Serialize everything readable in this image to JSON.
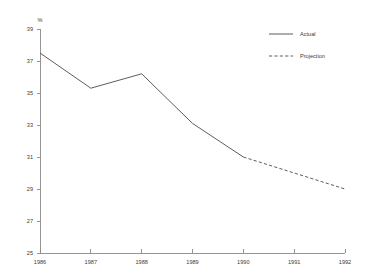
{
  "chart_data": {
    "type": "line",
    "title": "",
    "subtitle": "",
    "xlabel": "",
    "ylabel": "%",
    "y_unit_label": "%",
    "x": [
      1986,
      1987,
      1988,
      1989,
      1990,
      1991,
      1992
    ],
    "xtick_labels": [
      "1986",
      "1987",
      "1988",
      "1989",
      "1990",
      "1991",
      "1992"
    ],
    "ytick_labels": [
      "25",
      "27",
      "29",
      "31",
      "33",
      "35",
      "37",
      "39"
    ],
    "ytick_values": [
      25,
      27,
      29,
      31,
      33,
      35,
      37,
      39
    ],
    "ylim": [
      25,
      39
    ],
    "xlim": [
      1986,
      1992
    ],
    "grid": false,
    "legend_position": "top-right",
    "series": [
      {
        "name": "Actual",
        "style": "solid",
        "color": "#4a4a4a",
        "x": [
          1986,
          1987,
          1988,
          1989,
          1990
        ],
        "values": [
          37.5,
          35.3,
          36.2,
          33.1,
          31.0
        ]
      },
      {
        "name": "Projection",
        "style": "dashed",
        "color": "#4a4a4a",
        "x": [
          1990,
          1991,
          1992
        ],
        "values": [
          31.0,
          30.0,
          29.0
        ]
      }
    ],
    "annotations": []
  },
  "legend": {
    "entries": [
      {
        "label": "Actual",
        "style": "solid"
      },
      {
        "label": "Projection",
        "style": "dashed"
      }
    ]
  },
  "colors": {
    "background": "#ffffff",
    "axis": "#8a8a8a",
    "line": "#4a4a4a",
    "text": "#3a3a3a"
  }
}
